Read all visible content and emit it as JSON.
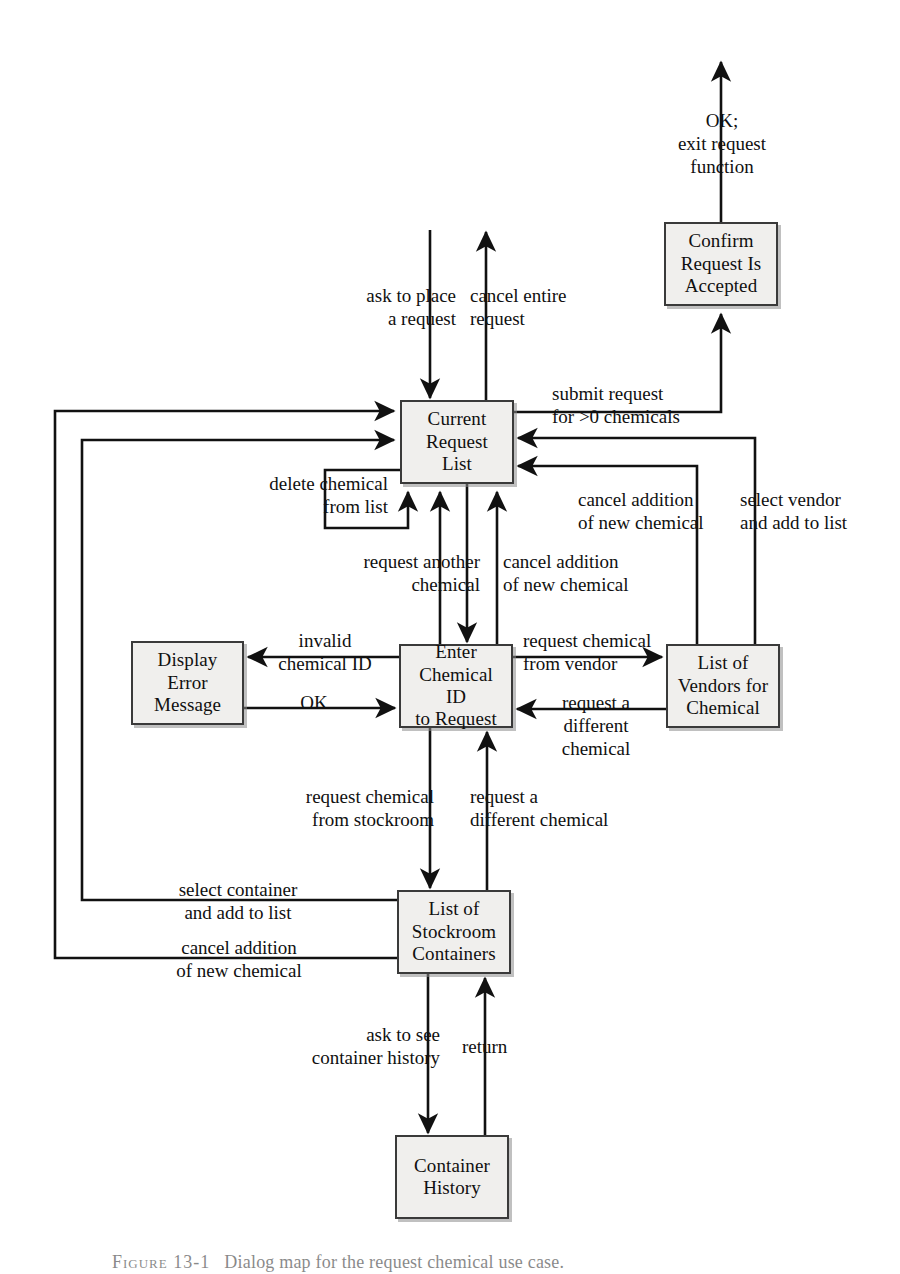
{
  "figure": {
    "type": "state-transition-diagram",
    "caption_prefix": "Figure 13-1",
    "caption_text": "Dialog map for the request chemical use case."
  },
  "nodes": [
    {
      "id": "confirm",
      "name": "confirm-request-accepted-node",
      "lines": [
        "Confirm",
        "Request Is",
        "Accepted"
      ],
      "x": 664,
      "y": 222,
      "w": 114,
      "h": 84
    },
    {
      "id": "current",
      "name": "current-request-list-node",
      "lines": [
        "Current",
        "Request",
        "List"
      ],
      "x": 400,
      "y": 400,
      "w": 114,
      "h": 84
    },
    {
      "id": "error",
      "name": "display-error-message-node",
      "lines": [
        "Display",
        "Error",
        "Message"
      ],
      "x": 131,
      "y": 641,
      "w": 113,
      "h": 84
    },
    {
      "id": "enterid",
      "name": "enter-chemical-id-node",
      "lines": [
        "Enter",
        "Chemical ID",
        "to Request"
      ],
      "x": 399,
      "y": 644,
      "w": 114,
      "h": 84
    },
    {
      "id": "vendors",
      "name": "list-of-vendors-node",
      "lines": [
        "List of",
        "Vendors for",
        "Chemical"
      ],
      "x": 666,
      "y": 644,
      "w": 114,
      "h": 84
    },
    {
      "id": "stockroom",
      "name": "list-of-stockroom-containers-node",
      "lines": [
        "List of",
        "Stockroom",
        "Containers"
      ],
      "x": 397,
      "y": 890,
      "w": 114,
      "h": 84
    },
    {
      "id": "history",
      "name": "container-history-node",
      "lines": [
        "Container",
        "History"
      ],
      "x": 395,
      "y": 1135,
      "w": 114,
      "h": 84
    }
  ],
  "edge_labels": [
    {
      "id": "ok-exit",
      "name": "edge-label-ok-exit-request-function",
      "text": "OK;\nexit request\nfunction",
      "x": 652,
      "y": 110,
      "w": 140,
      "align": "center"
    },
    {
      "id": "ask-place",
      "name": "edge-label-ask-to-place-a-request",
      "text": "ask to place\na request",
      "x": 330,
      "y": 285,
      "w": 126,
      "align": "right"
    },
    {
      "id": "cancel-entire",
      "name": "edge-label-cancel-entire-request",
      "text": "cancel entire\nrequest",
      "x": 470,
      "y": 285,
      "w": 140,
      "align": "left"
    },
    {
      "id": "submit-request",
      "name": "edge-label-submit-request",
      "text": "submit request\nfor >0 chemicals",
      "x": 552,
      "y": 383,
      "w": 170,
      "align": "left"
    },
    {
      "id": "delete-chemical",
      "name": "edge-label-delete-chemical-from-list",
      "text": "delete chemical\nfrom list",
      "x": 228,
      "y": 473,
      "w": 160,
      "align": "right"
    },
    {
      "id": "cancel-add-right",
      "name": "edge-label-cancel-addition-of-new-chemical-right",
      "text": "cancel addition\nof new chemical",
      "x": 578,
      "y": 489,
      "w": 164,
      "align": "left"
    },
    {
      "id": "select-vendor",
      "name": "edge-label-select-vendor-and-add-to-list",
      "text": "select vendor\nand add to list",
      "x": 740,
      "y": 489,
      "w": 152,
      "align": "left"
    },
    {
      "id": "request-another",
      "name": "edge-label-request-another-chemical",
      "text": "request another\nchemical",
      "x": 320,
      "y": 551,
      "w": 160,
      "align": "right"
    },
    {
      "id": "cancel-add-mid",
      "name": "edge-label-cancel-addition-of-new-chemical-mid",
      "text": "cancel addition\nof new chemical",
      "x": 503,
      "y": 551,
      "w": 170,
      "align": "left"
    },
    {
      "id": "invalid-id",
      "name": "edge-label-invalid-chemical-id",
      "text": "invalid\nchemical ID",
      "x": 258,
      "y": 630,
      "w": 134,
      "align": "center"
    },
    {
      "id": "request-from-vendor",
      "name": "edge-label-request-chemical-from-vendor",
      "text": "request chemical\nfrom vendor",
      "x": 523,
      "y": 630,
      "w": 164,
      "align": "left"
    },
    {
      "id": "ok",
      "name": "edge-label-ok",
      "text": "OK",
      "x": 292,
      "y": 692,
      "w": 44,
      "align": "center"
    },
    {
      "id": "request-diff-vendor",
      "name": "edge-label-request-a-different-chemical-vendor",
      "text": "request a\ndifferent\nchemical",
      "x": 532,
      "y": 692,
      "w": 128,
      "align": "center"
    },
    {
      "id": "request-stockroom",
      "name": "edge-label-request-chemical-from-stockroom",
      "text": "request chemical\nfrom stockroom",
      "x": 258,
      "y": 786,
      "w": 176,
      "align": "right"
    },
    {
      "id": "request-diff-stock",
      "name": "edge-label-request-a-different-chemical-stockroom",
      "text": "request a\ndifferent chemical",
      "x": 470,
      "y": 786,
      "w": 186,
      "align": "left"
    },
    {
      "id": "select-container",
      "name": "edge-label-select-container-and-add-to-list",
      "text": "select container\nand add to list",
      "x": 150,
      "y": 879,
      "w": 176,
      "align": "center"
    },
    {
      "id": "cancel-add-left",
      "name": "edge-label-cancel-addition-of-new-chemical-left",
      "text": "cancel addition\nof new chemical",
      "x": 146,
      "y": 937,
      "w": 186,
      "align": "center"
    },
    {
      "id": "ask-history",
      "name": "edge-label-ask-to-see-container-history",
      "text": "ask to see\ncontainer history",
      "x": 262,
      "y": 1024,
      "w": 178,
      "align": "right"
    },
    {
      "id": "return",
      "name": "edge-label-return",
      "text": "return",
      "x": 462,
      "y": 1036,
      "w": 76,
      "align": "left"
    }
  ],
  "colors": {
    "node_fill": "#f0efed",
    "node_border": "#3a3a3a",
    "wire": "#111111",
    "page_background": "#ffffff"
  }
}
